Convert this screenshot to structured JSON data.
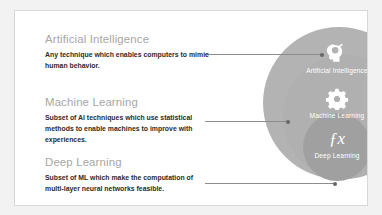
{
  "diagram": {
    "title_visible": false,
    "colors": {
      "slide_background": "#f2f2f2",
      "canvas_background": "#ffffff",
      "canvas_border": "#d8d8d8",
      "circle_ai": "#b3b3b3",
      "circle_ml": "#b0b0b0",
      "circle_dl": "#a0a0a0",
      "heading_text": "#a6a6a6",
      "body_text": "#2b2b2b",
      "ring_label_text": "#ffffff",
      "connector_line": "#8c8c8c",
      "connector_dot": "#666666"
    },
    "blocks": [
      {
        "id": "artificial-intelligence",
        "title": "Artificial Intelligence",
        "body": "Any technique which enables computers to mimic human behavior."
      },
      {
        "id": "machine-learning",
        "title": "Machine Learning",
        "body": "Subset of AI techniques which use statistical methods to enable machines to improve with experiences."
      },
      {
        "id": "deep-learning",
        "title": "Deep Learning",
        "body": "Subset of ML which make the computation of multi-layer neural networks feasible."
      }
    ],
    "rings": [
      {
        "id": "ring-ai",
        "label": "Artificial Intelligence",
        "icon": "head-brain-icon"
      },
      {
        "id": "ring-ml",
        "label": "Machine Learning",
        "icon": "gear-icon"
      },
      {
        "id": "ring-dl",
        "label": "Deep Learning",
        "icon": "function-fx-icon",
        "icon_text": "ƒx"
      }
    ]
  }
}
